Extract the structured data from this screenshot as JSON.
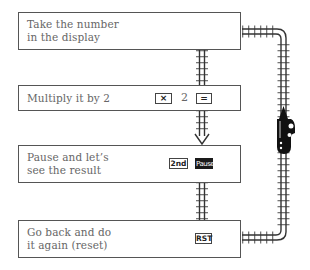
{
  "steps": [
    {
      "label": "Take the number\nin the display",
      "keys": []
    },
    {
      "label": "Multiply it by 2",
      "keys": [
        "×",
        "2",
        "="
      ]
    },
    {
      "label": "Pause and let’s\nsee the result",
      "keys": [
        "2nd",
        "Pause"
      ]
    },
    {
      "label": "Go back and do\nit again (reset)",
      "keys": [
        "RST"
      ]
    }
  ],
  "colors": {
    "line": "#333333",
    "train": "#111111",
    "text": "#666666"
  }
}
